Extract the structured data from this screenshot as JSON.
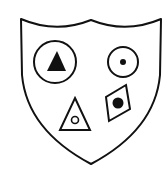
{
  "figure": {
    "colors": {
      "stroke": "#111111",
      "fill": "#ffffff",
      "solid": "#111111"
    },
    "shield": {
      "shape": "shield-outline"
    },
    "symbols": [
      {
        "name": "circle-with-filled-triangle",
        "position": "top-left"
      },
      {
        "name": "circle-with-dot",
        "position": "top-right"
      },
      {
        "name": "triangle-with-small-circle",
        "position": "bottom-left"
      },
      {
        "name": "diamond-with-filled-circle",
        "position": "bottom-right"
      }
    ]
  }
}
